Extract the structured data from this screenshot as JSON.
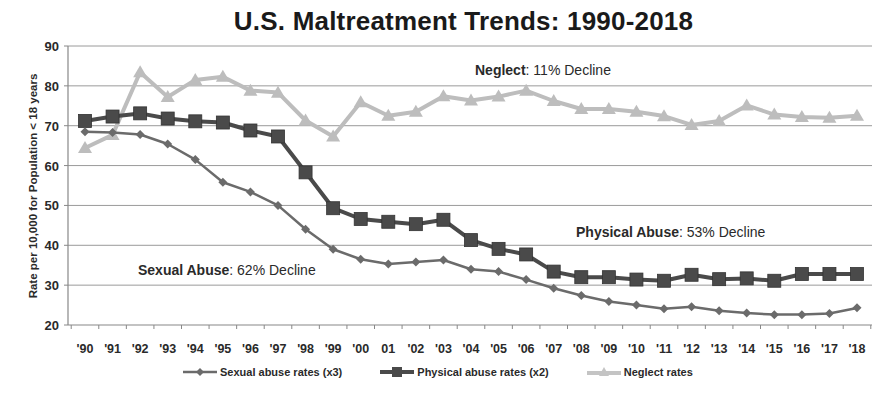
{
  "chart_data": {
    "type": "line",
    "title": "U.S. Maltreatment Trends:  1990-2018",
    "xlabel": "",
    "ylabel": "Rate per 10,000  for Population  < 18 years",
    "ylim": [
      20,
      90
    ],
    "yticks": [
      20,
      30,
      40,
      50,
      60,
      70,
      80,
      90
    ],
    "grid": true,
    "legend_position": "bottom",
    "categories": [
      "'90",
      "'91",
      "'92",
      "'93",
      "'94",
      "'95",
      "'96",
      "'97",
      "'98",
      "'99",
      "'00",
      "01",
      "'02",
      "'03",
      "'04",
      "'05",
      "'06",
      "'07",
      "'08",
      "'09",
      "'10",
      "'11",
      "'12",
      "'13",
      "'14",
      "'15",
      "'16",
      "'17",
      "'18"
    ],
    "series": [
      {
        "name": "Sexual abuse rates (x3)",
        "marker": "diamond",
        "color": "#6b6b6b",
        "values": [
          68.5,
          68.3,
          67.8,
          65.4,
          61.5,
          55.8,
          53.4,
          50.0,
          44.0,
          39.0,
          36.5,
          35.3,
          35.8,
          36.3,
          34.0,
          33.4,
          31.4,
          29.2,
          27.4,
          25.9,
          25.0,
          24.1,
          24.6,
          23.6,
          23.0,
          22.6,
          22.6,
          22.9,
          24.3
        ]
      },
      {
        "name": "Physical abuse rates (x2)",
        "marker": "square",
        "color": "#4a4a4a",
        "values": [
          71.2,
          72.3,
          73.1,
          71.8,
          71.1,
          70.8,
          68.8,
          67.3,
          58.3,
          49.3,
          46.6,
          45.9,
          45.3,
          46.4,
          41.3,
          39.1,
          37.7,
          33.4,
          32.0,
          32.0,
          31.4,
          31.1,
          32.6,
          31.5,
          31.7,
          31.1,
          32.8,
          32.8,
          32.8
        ]
      },
      {
        "name": "Neglect rates",
        "marker": "triangle",
        "color": "#bdbdbd",
        "values": [
          64.4,
          67.7,
          83.4,
          77.2,
          81.5,
          82.3,
          78.8,
          78.3,
          71.3,
          67.3,
          75.9,
          72.5,
          73.5,
          77.4,
          76.3,
          77.3,
          78.8,
          76.2,
          74.2,
          74.2,
          73.5,
          72.4,
          70.2,
          71.2,
          75.1,
          72.8,
          72.2,
          72.0,
          72.5
        ]
      }
    ],
    "annotations": [
      {
        "bold": "Neglect",
        "rest": ": 11% Decline"
      },
      {
        "bold": "Physical Abuse",
        "rest": ": 53% Decline"
      },
      {
        "bold": "Sexual Abuse",
        "rest": ":  62% Decline"
      }
    ]
  }
}
